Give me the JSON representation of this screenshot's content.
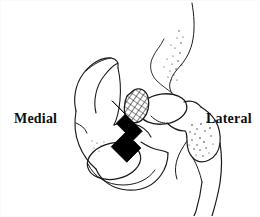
{
  "figure": {
    "kind": "anatomical-line-drawing",
    "background_color": "#ffffff",
    "ink_color": "#1a1a1a",
    "labels": {
      "medial": "Medial",
      "lateral": "Lateral"
    },
    "annotations": {
      "arrow": {
        "name": "black-arrow",
        "fill": "#000000",
        "direction": "up-right",
        "points_to": "hatched lesion on superior femoral head"
      },
      "hatched_region": {
        "name": "cross-hatched-lesion",
        "pattern": "diagonal cross-hatch",
        "location": "superomedial femoral head"
      },
      "stipple": {
        "name": "stippled-shading",
        "pattern": "fine dots",
        "locations": [
          "femoral neck",
          "greater trochanter",
          "acetabular roof"
        ]
      }
    },
    "structures": [
      "ilium",
      "acetabulum",
      "obturator foramen",
      "pubic ramus",
      "femoral head",
      "femoral neck",
      "greater trochanter",
      "femoral shaft"
    ]
  }
}
